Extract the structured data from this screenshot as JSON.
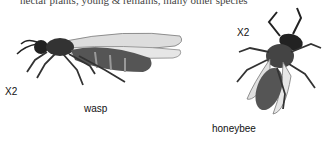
{
  "page": {
    "top_text_fragment": "nectar plants, young & remains, many other species",
    "top_text_note": "top line clipped at image edge; wording approximate"
  },
  "figures": [
    {
      "name": "wasp",
      "caption": "wasp",
      "scale": "X2"
    },
    {
      "name": "honeybee",
      "caption": "honeybee",
      "scale": "X2"
    }
  ]
}
